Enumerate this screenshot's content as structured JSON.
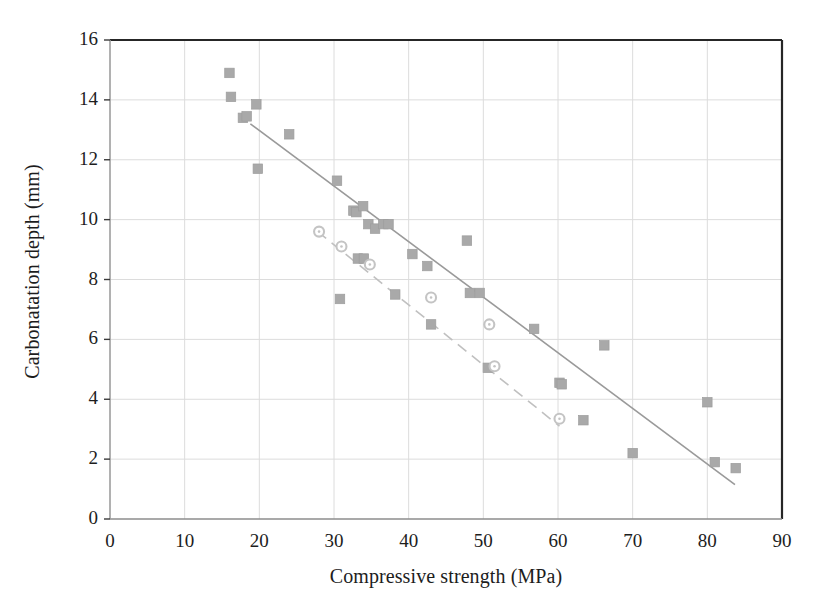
{
  "chart_data": {
    "type": "scatter",
    "title": "",
    "xlabel": "Compressive strength (MPa)",
    "ylabel": "Carbonatation depth (mm)",
    "xlim": [
      0,
      90
    ],
    "ylim": [
      0,
      16
    ],
    "xticks": [
      0,
      10,
      20,
      30,
      40,
      50,
      60,
      70,
      80,
      90
    ],
    "yticks": [
      0,
      2,
      4,
      6,
      8,
      10,
      12,
      14,
      16
    ],
    "grid": true,
    "legend": "none",
    "series": [
      {
        "name": "series-squares",
        "marker": "square",
        "color": "#a9a9a9",
        "points": [
          [
            16.0,
            14.9
          ],
          [
            16.2,
            14.1
          ],
          [
            17.8,
            13.4
          ],
          [
            18.3,
            13.45
          ],
          [
            19.6,
            13.85
          ],
          [
            19.8,
            11.7
          ],
          [
            24.0,
            12.85
          ],
          [
            30.4,
            11.3
          ],
          [
            30.8,
            7.35
          ],
          [
            32.6,
            10.3
          ],
          [
            33.0,
            10.25
          ],
          [
            33.9,
            10.45
          ],
          [
            33.2,
            8.7
          ],
          [
            34.0,
            8.7
          ],
          [
            34.6,
            9.85
          ],
          [
            35.5,
            9.7
          ],
          [
            36.6,
            9.85
          ],
          [
            37.3,
            9.85
          ],
          [
            38.2,
            7.5
          ],
          [
            40.5,
            8.85
          ],
          [
            42.5,
            8.45
          ],
          [
            43.0,
            6.5
          ],
          [
            47.8,
            9.3
          ],
          [
            48.2,
            7.55
          ],
          [
            49.5,
            7.55
          ],
          [
            50.6,
            5.05
          ],
          [
            56.8,
            6.35
          ],
          [
            60.2,
            4.55
          ],
          [
            60.5,
            4.5
          ],
          [
            63.4,
            3.3
          ],
          [
            66.2,
            5.8
          ],
          [
            70.0,
            2.2
          ],
          [
            80.0,
            3.9
          ],
          [
            81.0,
            1.9
          ],
          [
            83.8,
            1.7
          ]
        ]
      },
      {
        "name": "series-circles",
        "marker": "circle",
        "color": "#c4c4c4",
        "points": [
          [
            28.0,
            9.6
          ],
          [
            31.0,
            9.1
          ],
          [
            34.8,
            8.5
          ],
          [
            43.0,
            7.4
          ],
          [
            50.8,
            6.5
          ],
          [
            51.5,
            5.1
          ],
          [
            60.2,
            3.35
          ]
        ]
      }
    ],
    "trendlines": [
      {
        "name": "solid-trendline",
        "style": "solid",
        "color": "#9a9a9a",
        "from": [
          18.8,
          13.2
        ],
        "to": [
          83.7,
          1.15
        ]
      },
      {
        "name": "dashed-trendline",
        "style": "dashed",
        "color": "#c0c0c0",
        "from": [
          27.8,
          9.6
        ],
        "to": [
          60.2,
          3.1
        ]
      }
    ],
    "axis_color": "#262626",
    "grid_color": "#dcdcdc",
    "background": "#ffffff"
  }
}
